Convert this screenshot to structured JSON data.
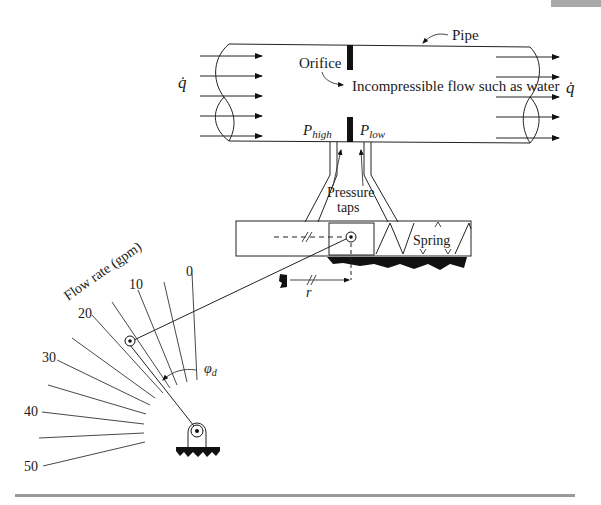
{
  "diagram": {
    "pipe": {
      "label": "Pipe",
      "orifice_label": "Orifice",
      "flow_description": "Incompressible flow such as water",
      "inlet_flow_symbol": "q̇",
      "outlet_flow_symbol": "q̇",
      "pressure_high": {
        "symbol": "P",
        "subscript": "high"
      },
      "pressure_low": {
        "symbol": "P",
        "subscript": "low"
      }
    },
    "taps": {
      "label_line1": "Pressure",
      "label_line2": "taps"
    },
    "mechanism": {
      "spring_label": "Spring",
      "radius_label": "r",
      "angle_label": {
        "symbol": "φ",
        "subscript": "d"
      }
    },
    "dial": {
      "axis_label": "Flow rate (gpm)",
      "scale_labels": [
        "0",
        "10",
        "20",
        "30",
        "40",
        "50"
      ],
      "units": "gpm",
      "min": 0,
      "max": 50,
      "minor_step": 5
    },
    "page_tab_color": "#a8a8a8",
    "rule_color": "#9a9a9a",
    "caption_partial": "FIGURE ... Mechanical flow ..."
  }
}
